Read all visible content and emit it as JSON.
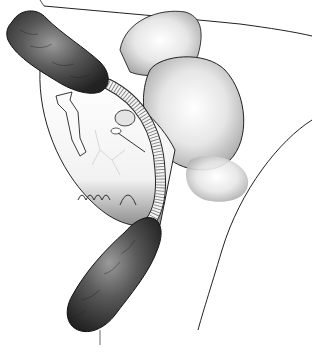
{
  "illustration": {
    "style": "grayscale medical line-and-shade illustration",
    "colors": {
      "background": "#ffffff",
      "outline": "#1a1a1a",
      "mass_dark": "#2b2b2b",
      "mass_mid": "#5a5a5a",
      "mass_light": "#9a9a9a",
      "organ_shade": "#bdbdbd",
      "tube_fill": "#f4f4f4",
      "tube_ribs": "#555555"
    },
    "elements": [
      {
        "name": "upper-tissue-mass",
        "description": "dark textured elongated mass, upper left"
      },
      {
        "name": "lower-tissue-mass",
        "description": "dark textured elongated mass, lower center"
      },
      {
        "name": "ribbed-tube",
        "description": "corrugated tube linking the two masses"
      },
      {
        "name": "central-organ",
        "description": "white organ outline with shaded lower rim and small vessels"
      },
      {
        "name": "right-bulbous-shapes",
        "description": "three rounded shaded lobes, upper right"
      },
      {
        "name": "outline-curves",
        "description": "thin contour lines framing the scene"
      }
    ]
  }
}
